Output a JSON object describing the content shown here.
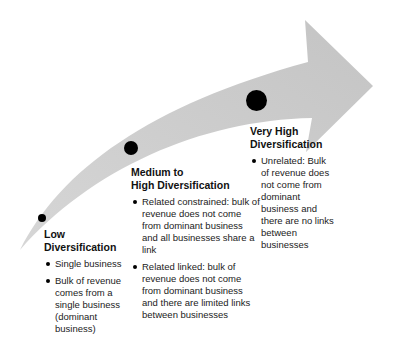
{
  "diagram": {
    "type": "curved-progression-arrow",
    "arrow_color": "#c8c8c8",
    "dot_color": "#000000",
    "stages": [
      {
        "title_line1": "Low",
        "title_line2": "Diversification",
        "bullets": [
          "Single business",
          "Bulk of revenue comes from a single business (dominant business)"
        ]
      },
      {
        "title_line1": "Medium to",
        "title_line2": "High Diversification",
        "bullets": [
          "Related constrained: bulk of revenue does not come from dominant business and all businesses share a link",
          "Related linked: bulk of revenue does not come from dominant business and there are limited links between businesses"
        ]
      },
      {
        "title_line1": "Very High",
        "title_line2": "Diversification",
        "bullets": [
          "Unrelated: Bulk of revenue does not come from dominant business and there are no links between businesses"
        ]
      }
    ]
  }
}
